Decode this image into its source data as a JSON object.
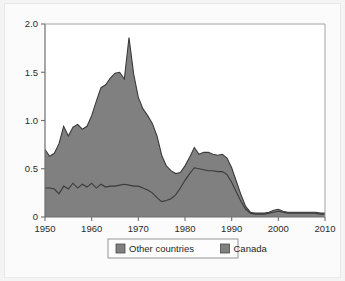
{
  "chart_data": {
    "type": "area",
    "stacked": true,
    "title": "",
    "xlabel": "",
    "ylabel": "",
    "xlim": [
      1950,
      2010
    ],
    "ylim": [
      0,
      2.0
    ],
    "xticks": [
      1950,
      1960,
      1970,
      1980,
      1990,
      2000,
      2010
    ],
    "xtick_labels": [
      "1950",
      "1960",
      "1970",
      "1980",
      "1990",
      "2000",
      "2010"
    ],
    "yticks": [
      0,
      0.5,
      1.0,
      1.5,
      2.0
    ],
    "ytick_labels": [
      "0",
      "0.5",
      "1.0",
      "1.5",
      "2.0"
    ],
    "grid": false,
    "legend_position": "below-center",
    "x": [
      1950,
      1951,
      1952,
      1953,
      1954,
      1955,
      1956,
      1957,
      1958,
      1959,
      1960,
      1961,
      1962,
      1963,
      1964,
      1965,
      1966,
      1967,
      1968,
      1969,
      1970,
      1971,
      1972,
      1973,
      1974,
      1975,
      1976,
      1977,
      1978,
      1979,
      1980,
      1981,
      1982,
      1983,
      1984,
      1985,
      1986,
      1987,
      1988,
      1989,
      1990,
      1991,
      1992,
      1993,
      1994,
      1995,
      1996,
      1997,
      1998,
      1999,
      2000,
      2001,
      2002,
      2003,
      2004,
      2005,
      2006,
      2007,
      2008,
      2009,
      2010
    ],
    "series": [
      {
        "name": "Canada",
        "color": "#808080",
        "values": [
          0.3,
          0.3,
          0.29,
          0.24,
          0.32,
          0.29,
          0.35,
          0.3,
          0.34,
          0.31,
          0.35,
          0.3,
          0.34,
          0.31,
          0.32,
          0.32,
          0.33,
          0.34,
          0.33,
          0.32,
          0.32,
          0.3,
          0.28,
          0.25,
          0.2,
          0.16,
          0.17,
          0.19,
          0.23,
          0.3,
          0.38,
          0.45,
          0.51,
          0.5,
          0.49,
          0.48,
          0.48,
          0.47,
          0.47,
          0.44,
          0.36,
          0.26,
          0.16,
          0.08,
          0.04,
          0.03,
          0.03,
          0.03,
          0.04,
          0.05,
          0.06,
          0.05,
          0.04,
          0.04,
          0.04,
          0.04,
          0.04,
          0.04,
          0.04,
          0.03,
          0.03
        ]
      },
      {
        "name": "Other countries",
        "color": "#808080",
        "values": [
          0.4,
          0.33,
          0.37,
          0.52,
          0.62,
          0.55,
          0.58,
          0.66,
          0.57,
          0.63,
          0.7,
          0.9,
          1.0,
          1.06,
          1.12,
          1.17,
          1.17,
          1.09,
          1.53,
          1.16,
          0.92,
          0.82,
          0.77,
          0.72,
          0.64,
          0.48,
          0.36,
          0.29,
          0.22,
          0.16,
          0.15,
          0.17,
          0.21,
          0.15,
          0.18,
          0.19,
          0.17,
          0.17,
          0.18,
          0.17,
          0.15,
          0.11,
          0.07,
          0.03,
          0.01,
          0.01,
          0.01,
          0.01,
          0.01,
          0.02,
          0.02,
          0.01,
          0.01,
          0.01,
          0.01,
          0.01,
          0.01,
          0.01,
          0.01,
          0.01,
          0.01
        ]
      }
    ],
    "totals": [
      0.7,
      0.63,
      0.66,
      0.76,
      0.94,
      0.84,
      0.93,
      0.96,
      0.91,
      0.94,
      1.05,
      1.2,
      1.34,
      1.37,
      1.44,
      1.49,
      1.5,
      1.43,
      1.86,
      1.48,
      1.24,
      1.12,
      1.05,
      0.97,
      0.84,
      0.64,
      0.53,
      0.48,
      0.45,
      0.46,
      0.53,
      0.62,
      0.72,
      0.65,
      0.67,
      0.67,
      0.65,
      0.64,
      0.65,
      0.61,
      0.51,
      0.37,
      0.23,
      0.11,
      0.05,
      0.04,
      0.04,
      0.04,
      0.05,
      0.07,
      0.08,
      0.06,
      0.05,
      0.05,
      0.05,
      0.05,
      0.05,
      0.05,
      0.05,
      0.04,
      0.04
    ]
  },
  "legend": {
    "items": [
      {
        "label": "Other countries",
        "swatch_color": "#808080"
      },
      {
        "label": "Canada",
        "swatch_color": "#808080"
      }
    ]
  },
  "colors": {
    "area_fill": "#808080",
    "line_stroke": "#3a3a3a",
    "axis": "#6e6e6e",
    "page_background": "#f4f4f4",
    "plot_background": "#ffffff"
  }
}
